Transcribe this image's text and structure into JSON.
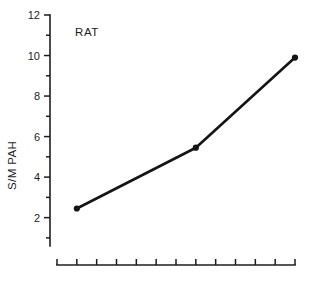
{
  "chart_data": {
    "type": "line",
    "title": "",
    "subtitle": "",
    "xlabel": "",
    "ylabel": "S/M  PAH",
    "annotations": [
      {
        "text": "RAT",
        "x_index": 1,
        "y_value": 11.3
      }
    ],
    "grid": false,
    "legend": false,
    "legend_position": "none",
    "ylim": [
      0.6,
      12
    ],
    "y_ticks_major": [
      2,
      4,
      6,
      8,
      10,
      12
    ],
    "y_tick_labels": [
      "2",
      "4",
      "6",
      "8",
      "10",
      "12"
    ],
    "y_ticks_minor": [
      1,
      3,
      5,
      7,
      9,
      11
    ],
    "xlim": [
      0,
      12
    ],
    "x_tick_count": 13,
    "x_tick_labels": [
      "",
      "",
      "",
      "",
      "",
      "",
      "",
      "",
      "",
      "",
      "",
      "",
      ""
    ],
    "x": [
      1,
      7,
      12
    ],
    "series": [
      {
        "name": "RAT",
        "values": [
          2.45,
          5.45,
          9.9
        ],
        "color": "#141414",
        "marker": "circle"
      }
    ]
  },
  "figure": {
    "background_color": "#ffffff",
    "axis_color": "#1d1d1d",
    "text_color": "#1d1d1d"
  }
}
